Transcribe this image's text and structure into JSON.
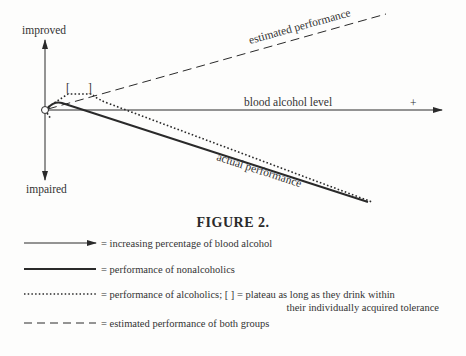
{
  "figure": {
    "title": "FIGURE 2.",
    "axes": {
      "y_top_label": "improved",
      "y_bottom_label": "impaired",
      "x_label": "blood alcohol level",
      "x_plus_sign": "+"
    },
    "curve_labels": {
      "estimated": "estimated performance",
      "actual": "actual performance"
    },
    "bracket_open": "[",
    "bracket_close": "]"
  },
  "legend": {
    "items": [
      {
        "style": "arrow",
        "text": "= increasing percentage of blood alcohol"
      },
      {
        "style": "solid",
        "text": "= performance of nonalcoholics"
      },
      {
        "style": "dotted",
        "text": "= performance of alcoholics; [ ] = plateau as long as they drink within",
        "text_line2": "their individually acquired tolerance"
      },
      {
        "style": "dashed",
        "text": "= estimated performance of both groups"
      }
    ]
  },
  "colors": {
    "ink": "#2a2a2a",
    "background": "#fdfdfc"
  }
}
